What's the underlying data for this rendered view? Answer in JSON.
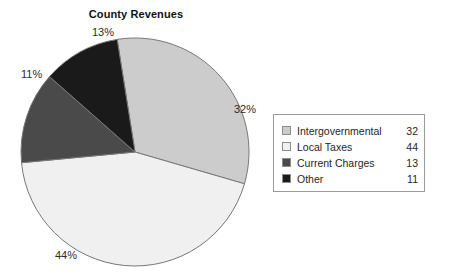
{
  "chart_data": {
    "type": "pie",
    "title": "County Revenues",
    "categories": [
      "Intergovernmental",
      "Local Taxes",
      "Current Charges",
      "Other"
    ],
    "values": [
      32,
      44,
      13,
      11
    ],
    "value_labels": [
      "32",
      "44",
      "13",
      "11"
    ],
    "percent_labels": [
      "32%",
      "44%",
      "13%",
      "11%"
    ],
    "colors": [
      "#cccccc",
      "#f0f0f0",
      "#4a4a4a",
      "#1a1a1a"
    ],
    "legend_position": "right",
    "grid": false,
    "xlabel": "",
    "ylabel": "",
    "start_angle_deg": -9,
    "direction": "clockwise",
    "slice_outline_color": "#777777"
  },
  "title": {
    "text": "County Revenues"
  },
  "pie": {
    "labels": {
      "intergovernmental": "32%",
      "local_taxes": "44%",
      "current_charges": "13%",
      "other": "11%"
    }
  },
  "legend": {
    "rows": [
      {
        "label": "Intergovernmental",
        "value": "32",
        "color": "#cccccc"
      },
      {
        "label": "Local Taxes",
        "value": "44",
        "color": "#f0f0f0"
      },
      {
        "label": "Current Charges",
        "value": "13",
        "color": "#4a4a4a"
      },
      {
        "label": "Other",
        "value": "11",
        "color": "#1a1a1a"
      }
    ]
  }
}
